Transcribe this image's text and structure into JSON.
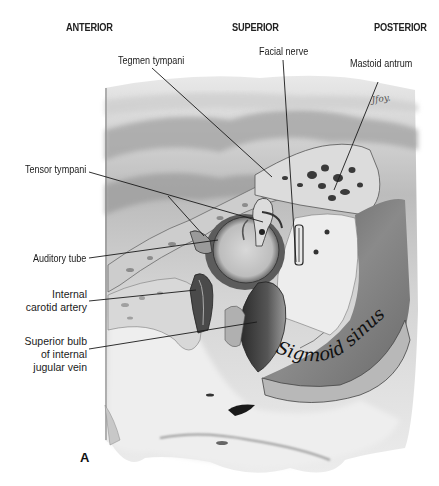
{
  "figure": {
    "panel_label": "A",
    "signature": "Jfoy.",
    "orientation": {
      "anterior": "ANTERIOR",
      "superior": "SUPERIOR",
      "posterior": "POSTERIOR"
    },
    "labels": {
      "tegmen_tympani": "Tegmen tympani",
      "facial_nerve": "Facial nerve",
      "mastoid_antrum": "Mastoid antrum",
      "tensor_tympani": "Tensor tympani",
      "auditory_tube": "Auditory tube",
      "internal_carotid_1": "Internal",
      "internal_carotid_2": "carotid artery",
      "jugular_1": "Superior bulb",
      "jugular_2": "of internal",
      "jugular_3": "jugular vein"
    },
    "in_image_text": "Sigmoid sinus"
  }
}
